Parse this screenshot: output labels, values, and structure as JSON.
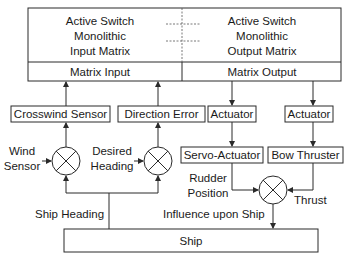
{
  "diagram": {
    "matrix": {
      "input_title": [
        "Active Switch",
        "Monolithic",
        "Input Matrix"
      ],
      "output_title": [
        "Active Switch",
        "Monolithic",
        "Output Matrix"
      ],
      "input_label": "Matrix Input",
      "output_label": "Matrix Output"
    },
    "blocks": {
      "crosswind_sensor": "Crosswind Sensor",
      "direction_error": "Direction Error",
      "actuator_1": "Actuator",
      "actuator_2": "Actuator",
      "servo_actuator": "Servo-Actuator",
      "bow_thruster": "Bow Thruster",
      "ship": "Ship"
    },
    "signals": {
      "wind_sensor": [
        "Wind",
        "Sensor"
      ],
      "desired_heading": [
        "Desired",
        "Heading"
      ],
      "rudder_position": [
        "Rudder",
        "Position"
      ],
      "thrust": "Thrust",
      "influence": "Influence upon Ship",
      "ship_heading": "Ship Heading"
    },
    "colors": {
      "stroke": "#2a2a2a",
      "background": "#ffffff",
      "text": "#1a1a1a"
    }
  }
}
